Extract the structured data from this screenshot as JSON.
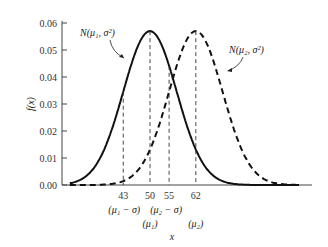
{
  "chart_data": {
    "type": "line",
    "title": "",
    "xlabel": "x",
    "ylabel": "f(x)",
    "ylim": [
      0,
      0.06
    ],
    "y_ticks": [
      "0.00",
      "0.01",
      "0.02",
      "0.03",
      "0.04",
      "0.05",
      "0.06"
    ],
    "x_ticks": [
      {
        "value": 43,
        "label": "43",
        "sublabel": "(μ₁ − σ)"
      },
      {
        "value": 50,
        "label": "50",
        "sublabel": "(μ₁)"
      },
      {
        "value": 55,
        "label": "55",
        "sublabel": "(μ₂ − σ)"
      },
      {
        "value": 62,
        "label": "62",
        "sublabel": "(μ₂)"
      }
    ],
    "grid": false,
    "series": [
      {
        "name": "N(μ₁, σ²)",
        "style": "solid",
        "mean": 50,
        "sigma": 7,
        "peak": 0.057
      },
      {
        "name": "N(μ₂, σ²)",
        "style": "dashed",
        "mean": 62,
        "sigma": 7,
        "peak": 0.057
      }
    ],
    "annotations": [
      {
        "text": "N(μ₁, σ²)",
        "points_to": "solid curve"
      },
      {
        "text": "N(μ₂, σ²)",
        "points_to": "dashed curve"
      }
    ]
  }
}
